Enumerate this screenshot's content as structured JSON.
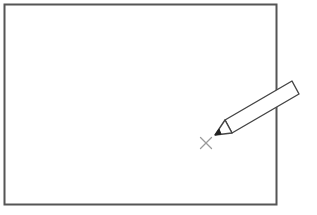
{
  "diagram": {
    "canvas_frame": {
      "x": 4,
      "y": 4,
      "width": 273,
      "height": 201,
      "stroke": "#555555",
      "stroke_width": 2
    },
    "pencil": {
      "tip": [
        215,
        135
      ],
      "collar": [
        [
          225,
          120
        ],
        [
          232,
          133
        ]
      ],
      "end": [
        [
          292,
          81
        ],
        [
          299,
          94
        ]
      ],
      "stroke": "#444444",
      "fill": "#ffffff",
      "lead_color": "#222222"
    },
    "cross_mark": {
      "center": [
        206,
        143
      ],
      "size": 6,
      "stroke": "#9a9a9a"
    }
  }
}
